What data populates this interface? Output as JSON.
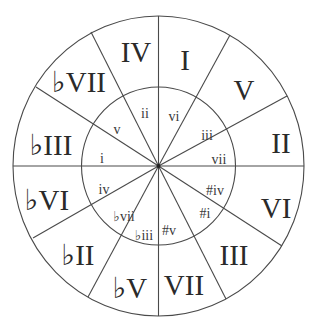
{
  "diagram": {
    "outer_ring_labels": [
      {
        "label": "I",
        "x": 185,
        "y": 70
      },
      {
        "label": "V",
        "x": 244,
        "y": 100
      },
      {
        "label": "II",
        "x": 281,
        "y": 153
      },
      {
        "label": "VI",
        "x": 276,
        "y": 218
      },
      {
        "label": "III",
        "x": 234,
        "y": 265
      },
      {
        "label": "VII",
        "x": 184,
        "y": 295
      },
      {
        "label": "♭V",
        "x": 130,
        "y": 298
      },
      {
        "label": "♭II",
        "x": 78,
        "y": 265
      },
      {
        "label": "♭VI",
        "x": 47,
        "y": 210
      },
      {
        "label": "♭III",
        "x": 51,
        "y": 155
      },
      {
        "label": "♭VII",
        "x": 79,
        "y": 92
      },
      {
        "label": "IV",
        "x": 136,
        "y": 62
      }
    ],
    "inner_ring_labels": [
      {
        "label": "vi",
        "x": 174,
        "y": 121
      },
      {
        "label": "iii",
        "x": 207,
        "y": 140
      },
      {
        "label": "vii",
        "x": 219,
        "y": 164
      },
      {
        "label": "#iv",
        "x": 215,
        "y": 195
      },
      {
        "label": "#i",
        "x": 205,
        "y": 218
      },
      {
        "label": "#v",
        "x": 169,
        "y": 235
      },
      {
        "label": "♭iii",
        "x": 144,
        "y": 240
      },
      {
        "label": "♭vii",
        "x": 124,
        "y": 221
      },
      {
        "label": "iv",
        "x": 104,
        "y": 194
      },
      {
        "label": "i",
        "x": 102,
        "y": 163
      },
      {
        "label": "v",
        "x": 117,
        "y": 134
      },
      {
        "label": "ii",
        "x": 145,
        "y": 118
      }
    ],
    "colors": {
      "line": "#4a4a4a",
      "text": "#2a2a2a",
      "background": "#ffffff"
    }
  }
}
